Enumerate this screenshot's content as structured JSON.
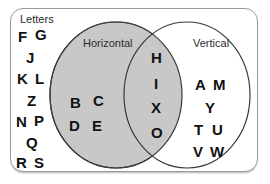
{
  "diagram": {
    "title_label": "Letters",
    "set_left_label": "Horizontal",
    "set_right_label": "Vertical",
    "colors": {
      "left_circle_fill": "#c8c8c8",
      "right_circle_fill": "#ffffff",
      "intersection_fill": "#c8c8c8",
      "circle_stroke": "#3a3a3a",
      "box_stroke": "#9a9a9a",
      "background": "#ffffff",
      "text": "#111111",
      "label_text": "#2b2b2b"
    }
  },
  "chart_data": {
    "type": "venn",
    "title": "Letters",
    "sets": [
      {
        "name": "Horizontal",
        "fill": "#c8c8c8"
      },
      {
        "name": "Vertical",
        "fill": "#ffffff"
      }
    ],
    "regions": {
      "universe_only": [
        "F",
        "G",
        "J",
        "K",
        "L",
        "Z",
        "N",
        "P",
        "Q",
        "R",
        "S"
      ],
      "left_only": [
        "B",
        "C",
        "D",
        "E"
      ],
      "intersection": [
        "H",
        "I",
        "X",
        "O"
      ],
      "right_only": [
        "A",
        "M",
        "Y",
        "T",
        "U",
        "V",
        "W"
      ]
    },
    "counts": {
      "universe_only": 11,
      "left_only": 4,
      "intersection": 4,
      "right_only": 7
    }
  },
  "letters": {
    "universe_only": [
      {
        "glyph": "F",
        "x": 18,
        "y": 29
      },
      {
        "glyph": "G",
        "x": 35,
        "y": 27
      },
      {
        "glyph": "J",
        "x": 26,
        "y": 50
      },
      {
        "glyph": "K",
        "x": 17,
        "y": 71
      },
      {
        "glyph": "L",
        "x": 35,
        "y": 71
      },
      {
        "glyph": "Z",
        "x": 27,
        "y": 93
      },
      {
        "glyph": "N",
        "x": 16,
        "y": 114
      },
      {
        "glyph": "P",
        "x": 34,
        "y": 113
      },
      {
        "glyph": "Q",
        "x": 26,
        "y": 135
      },
      {
        "glyph": "R",
        "x": 16,
        "y": 155
      },
      {
        "glyph": "S",
        "x": 34,
        "y": 155
      }
    ],
    "left_only": [
      {
        "glyph": "B",
        "x": 70,
        "y": 95
      },
      {
        "glyph": "C",
        "x": 93,
        "y": 93
      },
      {
        "glyph": "D",
        "x": 69,
        "y": 118
      },
      {
        "glyph": "E",
        "x": 92,
        "y": 118
      }
    ],
    "intersection": [
      {
        "glyph": "H",
        "x": 151,
        "y": 50
      },
      {
        "glyph": "I",
        "x": 154,
        "y": 76
      },
      {
        "glyph": "X",
        "x": 151,
        "y": 100
      },
      {
        "glyph": "O",
        "x": 151,
        "y": 125
      }
    ],
    "right_only": [
      {
        "glyph": "A",
        "x": 195,
        "y": 77
      },
      {
        "glyph": "M",
        "x": 213,
        "y": 77
      },
      {
        "glyph": "Y",
        "x": 205,
        "y": 100
      },
      {
        "glyph": "T",
        "x": 194,
        "y": 122
      },
      {
        "glyph": "U",
        "x": 212,
        "y": 122
      },
      {
        "glyph": "V",
        "x": 193,
        "y": 144
      },
      {
        "glyph": "W",
        "x": 210,
        "y": 144
      }
    ]
  },
  "geometry": {
    "left_circle": {
      "cx": 116,
      "cy": 95,
      "rx": 66,
      "ry": 73
    },
    "right_circle": {
      "cx": 187,
      "cy": 95,
      "rx": 63,
      "ry": 73
    },
    "title_pos": {
      "x": 20,
      "y": 14
    },
    "left_label_pos": {
      "x": 83,
      "y": 38
    },
    "right_label_pos": {
      "x": 193,
      "y": 38
    }
  }
}
